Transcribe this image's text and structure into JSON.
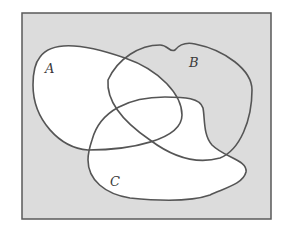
{
  "diagram": {
    "type": "venn",
    "universe": {
      "fill": "#dcdcdc",
      "stroke": "#5a5a5a"
    },
    "sets": [
      {
        "id": "A",
        "label": "A"
      },
      {
        "id": "B",
        "label": "B"
      },
      {
        "id": "C",
        "label": "C"
      }
    ],
    "shaded_region": "A ∪ C",
    "colors": {
      "shaded": "#ffffff",
      "unshaded": "#dcdcdc",
      "outline": "#555555"
    }
  }
}
